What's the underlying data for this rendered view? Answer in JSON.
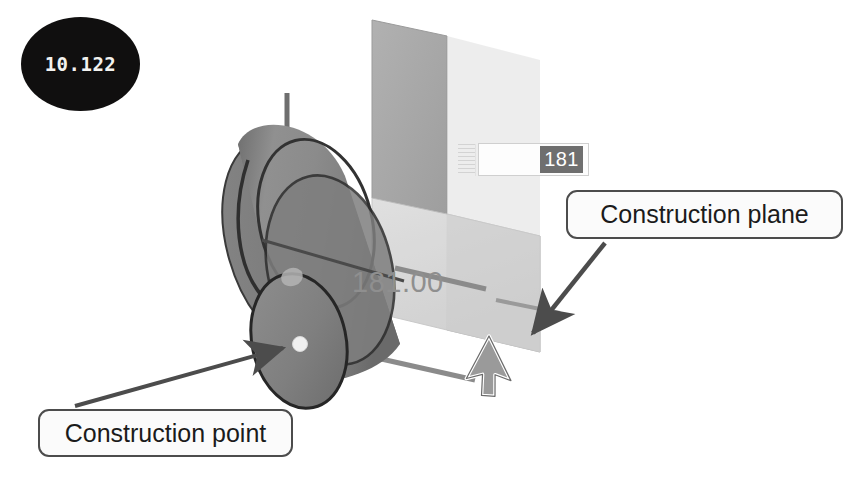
{
  "figure": {
    "step_badge": {
      "label": "10.122",
      "bg_color": "#100f0f",
      "text_color": "#f2f2ef"
    },
    "dimension_input": {
      "value": "181",
      "selected": true,
      "selection_bg": "#6f6f6f",
      "selection_text_color": "#ffffff"
    },
    "dimension_readout": {
      "value": "181.00",
      "color": "#8f8f8f"
    },
    "callouts": [
      {
        "id": "construction-plane",
        "label": "Construction plane",
        "border_color": "#4c4c4c",
        "bg_color": "#fbfbfb",
        "text_color": "#1b1b1b"
      },
      {
        "id": "construction-point",
        "label": "Construction point",
        "border_color": "#4c4c4c",
        "bg_color": "#fbfbfb",
        "text_color": "#1b1b1b"
      }
    ],
    "model": {
      "cylinder_color": "#8a8a8a",
      "cylinder_edge_color": "#2b2b2b",
      "upper_plane_color": "#a8a8a8",
      "lower_plane_color": "#d5d5d5",
      "axis_color": "#7b7b7b",
      "construction_point_color": "#f0f0f0",
      "leader_color": "#4c4c4c",
      "cursor_fill": "#9a9a9a",
      "cursor_outline": "#ffffff"
    }
  }
}
